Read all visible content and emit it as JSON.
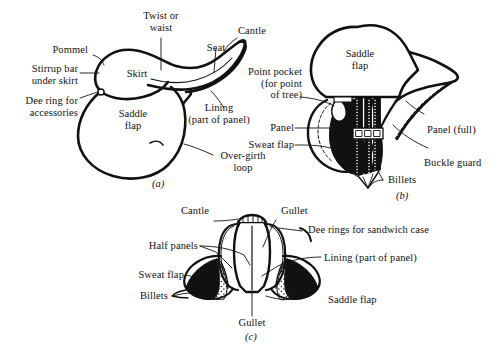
{
  "figure": {
    "background_color": "#ffffff",
    "ink_color": "#111111",
    "panels": [
      {
        "caption": "(a)",
        "name": "side-view",
        "outer_labels": [
          "Twist or\nwaist",
          "Pommel",
          "Seat",
          "Cantle",
          "Stirrup bar\nunder skirt",
          "Dee ring for\naccessories",
          "Lining\n(part of panel)",
          "Over-girth\nloop"
        ],
        "inner_labels": [
          "Skirt",
          "Saddle\nflap"
        ]
      },
      {
        "caption": "(b)",
        "name": "underside-view",
        "outer_labels": [
          "Point pocket\n(for point\nof tree)",
          "Panel",
          "Sweat flap",
          "Panel (full)",
          "Buckle guard",
          "Billets"
        ],
        "inner_labels": [
          "Saddle\nflap"
        ]
      },
      {
        "caption": "(c)",
        "name": "rear-view",
        "outer_labels": [
          "Cantle",
          "Gullet",
          "Dee rings for sandwich case",
          "Half panels",
          "Lining (part of panel)",
          "Sweat flap",
          "Saddle flap",
          "Billets",
          "Gullet"
        ],
        "inner_labels": []
      }
    ]
  },
  "panel_a": {
    "caption": "(a)",
    "label_twist": "Twist or\nwaist",
    "label_pommel": "Pommel",
    "label_seat": "Seat",
    "label_cantle": "Cantle",
    "label_stirrup_bar": "Stirrup bar\nunder skirt",
    "label_dee_ring": "Dee ring for\naccessories",
    "label_lining": "Lining\n(part of panel)",
    "label_overgirth": "Over-girth\nloop",
    "label_skirt": "Skirt",
    "label_saddle_flap": "Saddle\nflap"
  },
  "panel_b": {
    "caption": "(b)",
    "label_point_pocket": "Point pocket\n(for point\nof tree)",
    "label_panel": "Panel",
    "label_sweat_flap": "Sweat flap",
    "label_panel_full": "Panel (full)",
    "label_buckle_guard": "Buckle guard",
    "label_billets": "Billets",
    "label_saddle_flap": "Saddle\nflap"
  },
  "panel_c": {
    "caption": "(c)",
    "label_cantle": "Cantle",
    "label_gullet_top": "Gullet",
    "label_dee_rings": "Dee rings for sandwich case",
    "label_half_panels": "Half panels",
    "label_lining": "Lining (part of panel)",
    "label_sweat_flap": "Sweat flap",
    "label_saddle_flap": "Saddle flap",
    "label_billets": "Billets",
    "label_gullet_bottom": "Gullet"
  }
}
